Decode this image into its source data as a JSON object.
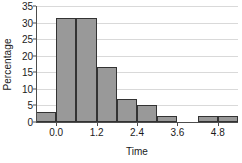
{
  "chart_data": {
    "type": "bar",
    "title": "",
    "subtitle": "",
    "xlabel": "Time",
    "ylabel": "Percentage",
    "grid": true,
    "legend": null,
    "xlim": [
      -0.6,
      5.4
    ],
    "ylim": [
      0,
      35
    ],
    "bin_width": 0.6,
    "x_tick_values": [
      0.0,
      1.2,
      2.4,
      3.6,
      4.8
    ],
    "x_tick_labels": [
      "0.0",
      "1.2",
      "2.4",
      "3.6",
      "4.8"
    ],
    "y_tick_values": [
      0,
      5,
      10,
      15,
      20,
      25,
      30,
      35
    ],
    "y_tick_labels": [
      "0",
      "5",
      "10",
      "15",
      "20",
      "25",
      "30",
      "35"
    ],
    "bin_edges": [
      -0.6,
      0.0,
      0.6,
      1.2,
      1.8,
      2.4,
      3.0,
      3.6,
      4.2,
      4.8,
      5.4
    ],
    "bins": [
      {
        "left": -0.6,
        "right": 0.0,
        "value": 3.1
      },
      {
        "left": 0.0,
        "right": 0.6,
        "value": 31.3
      },
      {
        "left": 0.6,
        "right": 1.2,
        "value": 31.3
      },
      {
        "left": 1.2,
        "right": 1.8,
        "value": 16.5
      },
      {
        "left": 1.8,
        "right": 2.4,
        "value": 7.0
      },
      {
        "left": 2.4,
        "right": 3.0,
        "value": 5.2
      },
      {
        "left": 3.0,
        "right": 3.6,
        "value": 1.7
      },
      {
        "left": 3.6,
        "right": 4.2,
        "value": 0.0
      },
      {
        "left": 4.2,
        "right": 4.8,
        "value": 1.7
      },
      {
        "left": 4.8,
        "right": 5.4,
        "value": 1.7
      }
    ],
    "values": [
      3.1,
      31.3,
      31.3,
      16.5,
      7.0,
      5.2,
      1.7,
      0.0,
      1.7,
      1.7
    ],
    "categories": [
      "-0.6",
      "0.0",
      "0.6",
      "1.2",
      "1.8",
      "2.4",
      "3.0",
      "3.6",
      "4.2",
      "4.8"
    ],
    "colors": {
      "bar_fill": "#999999",
      "bar_edge": "#333333",
      "gridline": "#d9d9d9",
      "axis": "#4d4d4d",
      "text": "#1a1a1a",
      "background": "#ffffff"
    }
  }
}
